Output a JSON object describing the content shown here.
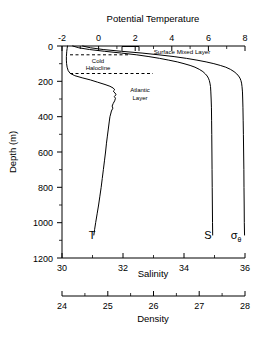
{
  "figure": {
    "title": "",
    "background": "#ffffff",
    "line_color": "#000000"
  },
  "chart_data": {
    "type": "line",
    "title": "",
    "orientation": "vertical-profile",
    "ylabel": "Depth (m)",
    "ylim": [
      0,
      1200
    ],
    "y_inverted": true,
    "y_ticks": [
      0,
      200,
      400,
      600,
      800,
      1000,
      1200
    ],
    "y_ticks_minor": [
      100,
      300,
      500,
      700,
      900,
      1100
    ],
    "grid": false,
    "legend": "inline-curve-labels",
    "axes": [
      {
        "name": "potential-temperature",
        "label": "Potential Temperature",
        "position": "top",
        "lim": [
          -2,
          8
        ],
        "ticks": [
          -2,
          0,
          2,
          4,
          6,
          8
        ],
        "ticks_minor": [
          -1,
          1,
          3,
          5,
          7
        ],
        "curve_label": "T"
      },
      {
        "name": "salinity",
        "label": "Salinity",
        "position": "bottom",
        "lim": [
          30,
          36
        ],
        "ticks": [
          30,
          32,
          34,
          36
        ],
        "ticks_minor": [
          31,
          33,
          35
        ],
        "curve_label": "S"
      },
      {
        "name": "density",
        "label": "Density",
        "position": "bottom-outer",
        "lim": [
          24,
          28
        ],
        "ticks": [
          24,
          25,
          26,
          27,
          28
        ],
        "ticks_minor": [
          24.5,
          25.5,
          26.5,
          27.5
        ],
        "curve_label": "σ"
      }
    ],
    "series": [
      {
        "name": "Potential Temperature",
        "label": "T",
        "axis": "potential-temperature",
        "units": "degC",
        "points": [
          [
            -1.7,
            0
          ],
          [
            -1.72,
            15
          ],
          [
            -1.74,
            30
          ],
          [
            -1.75,
            45
          ],
          [
            -1.76,
            60
          ],
          [
            -1.76,
            80
          ],
          [
            -1.75,
            100
          ],
          [
            -1.72,
            120
          ],
          [
            -1.66,
            140
          ],
          [
            -1.55,
            155
          ],
          [
            -1.3,
            168
          ],
          [
            -0.9,
            180
          ],
          [
            -0.45,
            192
          ],
          [
            -0.05,
            205
          ],
          [
            0.35,
            218
          ],
          [
            0.62,
            228
          ],
          [
            0.8,
            238
          ],
          [
            0.88,
            248
          ],
          [
            0.8,
            256
          ],
          [
            0.9,
            266
          ],
          [
            0.95,
            276
          ],
          [
            0.86,
            286
          ],
          [
            0.92,
            296
          ],
          [
            0.88,
            310
          ],
          [
            0.8,
            325
          ],
          [
            0.74,
            340
          ],
          [
            0.78,
            352
          ],
          [
            0.7,
            368
          ],
          [
            0.66,
            385
          ],
          [
            0.62,
            400
          ],
          [
            0.58,
            430
          ],
          [
            0.53,
            470
          ],
          [
            0.48,
            510
          ],
          [
            0.43,
            550
          ],
          [
            0.38,
            600
          ],
          [
            0.32,
            650
          ],
          [
            0.26,
            700
          ],
          [
            0.2,
            750
          ],
          [
            0.14,
            800
          ],
          [
            0.07,
            850
          ],
          [
            0.0,
            900
          ],
          [
            -0.08,
            950
          ],
          [
            -0.16,
            1000
          ],
          [
            -0.22,
            1040
          ],
          [
            -0.26,
            1070
          ]
        ]
      },
      {
        "name": "Salinity",
        "label": "S",
        "axis": "salinity",
        "units": "psu",
        "points": [
          [
            30.35,
            0
          ],
          [
            30.55,
            10
          ],
          [
            30.9,
            20
          ],
          [
            31.4,
            30
          ],
          [
            31.95,
            40
          ],
          [
            32.45,
            50
          ],
          [
            32.85,
            60
          ],
          [
            33.2,
            70
          ],
          [
            33.5,
            80
          ],
          [
            33.78,
            90
          ],
          [
            34.0,
            100
          ],
          [
            34.2,
            110
          ],
          [
            34.36,
            120
          ],
          [
            34.5,
            132
          ],
          [
            34.62,
            145
          ],
          [
            34.7,
            158
          ],
          [
            34.76,
            170
          ],
          [
            34.8,
            182
          ],
          [
            34.83,
            195
          ],
          [
            34.85,
            210
          ],
          [
            34.87,
            230
          ],
          [
            34.88,
            260
          ],
          [
            34.89,
            300
          ],
          [
            34.9,
            350
          ],
          [
            34.905,
            420
          ],
          [
            34.91,
            500
          ],
          [
            34.915,
            600
          ],
          [
            34.92,
            700
          ],
          [
            34.925,
            800
          ],
          [
            34.93,
            900
          ],
          [
            34.935,
            1000
          ],
          [
            34.94,
            1070
          ]
        ]
      },
      {
        "name": "Density (sigma-theta)",
        "label": "σ",
        "label_subscript": "θ",
        "axis": "density",
        "units": "kg/m3",
        "points": [
          [
            24.45,
            0
          ],
          [
            24.62,
            10
          ],
          [
            24.9,
            20
          ],
          [
            25.3,
            30
          ],
          [
            25.75,
            40
          ],
          [
            26.12,
            50
          ],
          [
            26.45,
            60
          ],
          [
            26.72,
            70
          ],
          [
            26.95,
            80
          ],
          [
            27.15,
            90
          ],
          [
            27.32,
            100
          ],
          [
            27.46,
            110
          ],
          [
            27.58,
            120
          ],
          [
            27.68,
            132
          ],
          [
            27.76,
            145
          ],
          [
            27.82,
            158
          ],
          [
            27.86,
            170
          ],
          [
            27.89,
            182
          ],
          [
            27.91,
            195
          ],
          [
            27.925,
            210
          ],
          [
            27.935,
            230
          ],
          [
            27.945,
            260
          ],
          [
            27.95,
            300
          ],
          [
            27.955,
            350
          ],
          [
            27.96,
            420
          ],
          [
            27.965,
            500
          ],
          [
            27.97,
            600
          ],
          [
            27.975,
            700
          ],
          [
            27.978,
            800
          ],
          [
            27.982,
            900
          ],
          [
            27.985,
            1000
          ],
          [
            27.99,
            1070
          ]
        ]
      }
    ],
    "annotations": [
      {
        "name": "surface-mixed-layer",
        "text": "Surface Mixed Layer",
        "depth": 18,
        "axis": "potential-temperature",
        "value": 4.2
      },
      {
        "name": "cold-halocline",
        "text": "Cold",
        "text2": "Halocline",
        "depth_top": 50,
        "depth_bottom": 160
      },
      {
        "name": "atlantic-layer",
        "text": "Atlantic",
        "text2": "Layer",
        "depth": 250,
        "axis": "potential-temperature",
        "value": 2.3
      }
    ]
  }
}
